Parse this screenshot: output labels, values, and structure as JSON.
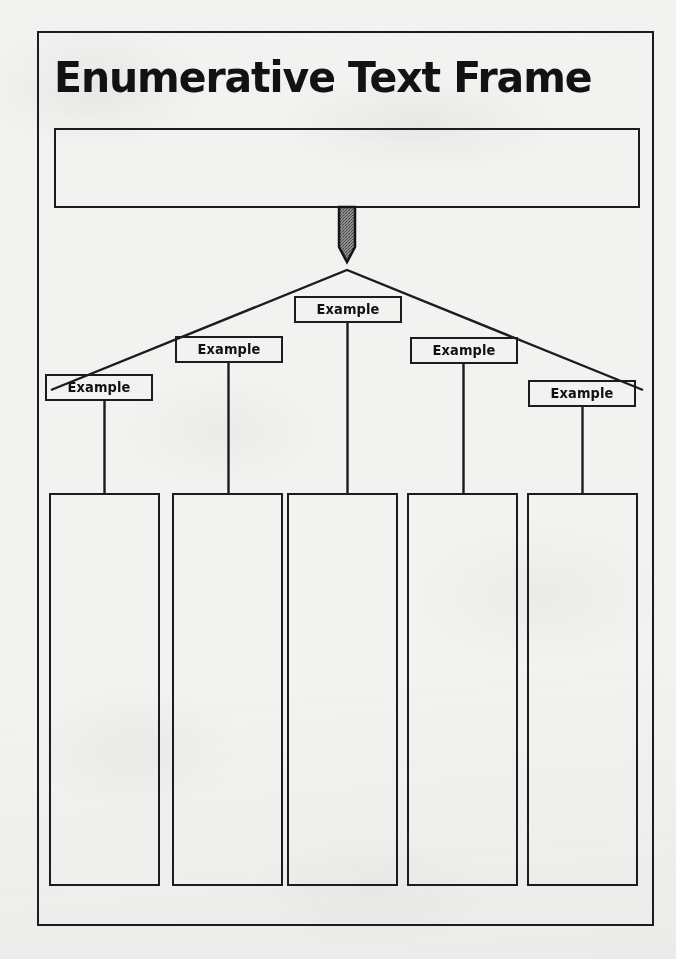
{
  "document": {
    "title": "Enumerative Text Frame",
    "type": "graphic-organizer-worksheet",
    "paper_color": "#f2f2f0",
    "ink_color": "#1c1c1c"
  },
  "main_idea": {
    "value": "",
    "placeholder": ""
  },
  "arrow": {
    "name": "down-arrow",
    "fill": "#7a7a7a",
    "direction": "down"
  },
  "examples": [
    {
      "label": "Example",
      "left": 45,
      "top": 374
    },
    {
      "label": "Example",
      "left": 175,
      "top": 336
    },
    {
      "label": "Example",
      "left": 294,
      "top": 296
    },
    {
      "label": "Example",
      "left": 410,
      "top": 337
    },
    {
      "label": "Example",
      "left": 528,
      "top": 380
    }
  ],
  "detail_columns": [
    {
      "value": "",
      "left": 49
    },
    {
      "value": "",
      "left": 172
    },
    {
      "value": "",
      "left": 287
    },
    {
      "value": "",
      "left": 407
    },
    {
      "value": "",
      "left": 527
    }
  ]
}
